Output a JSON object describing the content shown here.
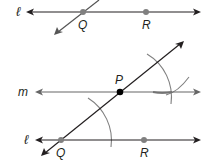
{
  "figure": {
    "top_panel": {
      "line_label": "ℓ",
      "points": [
        {
          "label": "Q",
          "color": "#808080"
        },
        {
          "label": "R",
          "color": "#808080"
        }
      ]
    },
    "bottom_panel": {
      "line_m_label": "m",
      "line_l_label": "ℓ",
      "points": [
        {
          "label": "P",
          "color": "#000000"
        },
        {
          "label": "Q",
          "color": "#808080"
        },
        {
          "label": "R",
          "color": "#808080"
        }
      ]
    },
    "colors": {
      "line": "#231f20",
      "construction_arc": "#808080",
      "point_given": "#808080",
      "point_P": "#000000"
    }
  }
}
